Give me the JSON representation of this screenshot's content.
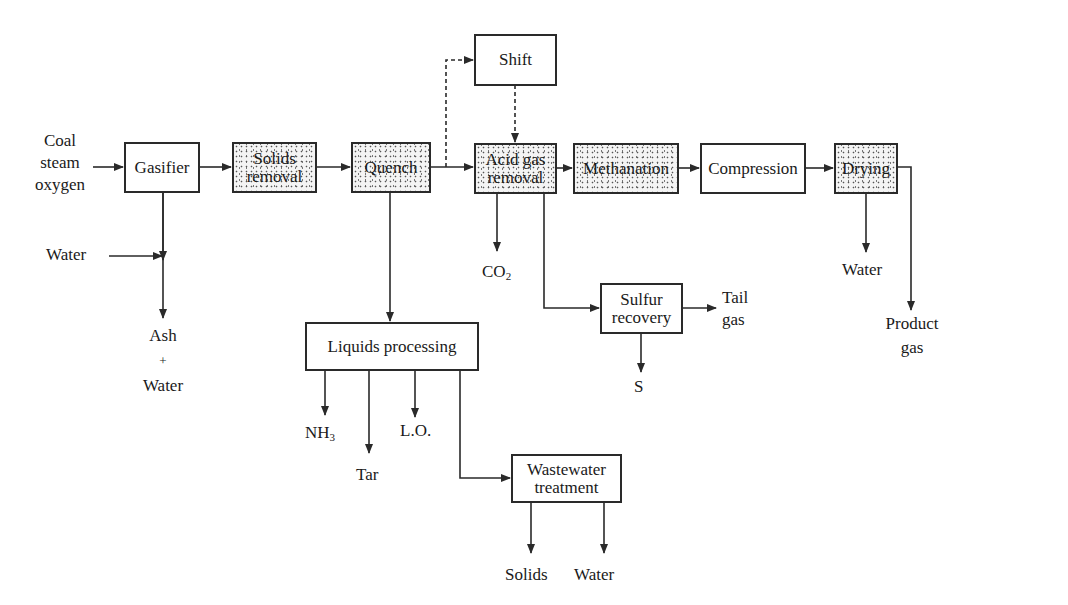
{
  "diagram": {
    "type": "process-flow",
    "boxes": {
      "gasifier": {
        "label": "Gasifier",
        "stippled": false
      },
      "solids_removal": {
        "line1": "Solids",
        "line2": "removal",
        "stippled": true
      },
      "quench": {
        "label": "Quench",
        "stippled": true
      },
      "shift": {
        "label": "Shift",
        "stippled": false
      },
      "acid_gas_removal": {
        "line1": "Acid gas",
        "line2": "removal",
        "stippled": true
      },
      "methanation": {
        "label": "Methanation",
        "stippled": true
      },
      "compression": {
        "label": "Compression",
        "stippled": false
      },
      "drying": {
        "label": "Drying",
        "stippled": true
      },
      "liquids_processing": {
        "label": "Liquids processing",
        "stippled": false
      },
      "wastewater_treatment": {
        "line1": "Wastewater",
        "line2": "treatment",
        "stippled": false
      },
      "sulfur_recovery": {
        "line1": "Sulfur",
        "line2": "recovery",
        "stippled": false
      }
    },
    "labels": {
      "feed": {
        "line1": "Coal",
        "line2": "steam",
        "line3": "oxygen"
      },
      "water_in": "Water",
      "ash_water": {
        "line1": "Ash",
        "line2": "+",
        "line3": "Water"
      },
      "co2": {
        "base": "CO",
        "sub": "2"
      },
      "nh3": {
        "base": "NH",
        "sub": "3"
      },
      "tar": "Tar",
      "lo": "L.O.",
      "solids": "Solids",
      "water_ww": "Water",
      "sulfur": "S",
      "tail_gas": {
        "line1": "Tail",
        "line2": "gas"
      },
      "water_drying": "Water",
      "product_gas": {
        "line1": "Product",
        "line2": "gas"
      }
    },
    "colors": {
      "line": "#2a2a2a",
      "background": "#ffffff",
      "stipple": "#555555"
    }
  }
}
